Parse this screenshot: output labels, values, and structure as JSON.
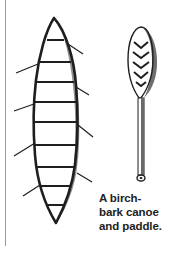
{
  "figure": {
    "caption_lines": [
      "A birch-",
      "bark canoe",
      "and paddle."
    ],
    "caption": "A birch-bark canoe and paddle.",
    "subjects": [
      "birch-bark canoe",
      "paddle"
    ]
  },
  "colors": {
    "ink": "#1e1e1e",
    "shading": "#555555",
    "rule": "#9a9a9a",
    "background": "#ffffff"
  }
}
